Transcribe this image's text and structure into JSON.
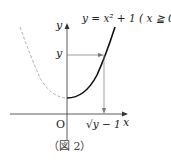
{
  "figure": {
    "equation": "y = x² + 1 ( x ≧ 0)",
    "y_axis_label": "y",
    "x_axis_label": "x",
    "y_marker_label": "y",
    "origin_label": "O",
    "x_marker_label": "√y − 1",
    "caption": "（図 2）"
  },
  "colors": {
    "curve": "#111111",
    "dashed": "#999999",
    "axis": "#333333",
    "arrow": "#777777"
  }
}
